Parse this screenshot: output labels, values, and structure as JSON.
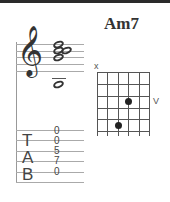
{
  "chord": {
    "name": "Am7",
    "notation": {
      "clef": "treble-clef",
      "clef_glyph": "𝄞"
    },
    "tab": {
      "letters": [
        "T",
        "A",
        "B"
      ],
      "frets": [
        "0",
        "0",
        "5",
        "7",
        "0"
      ]
    },
    "diagram": {
      "muted_marker": "x",
      "position_marker": "V"
    }
  }
}
